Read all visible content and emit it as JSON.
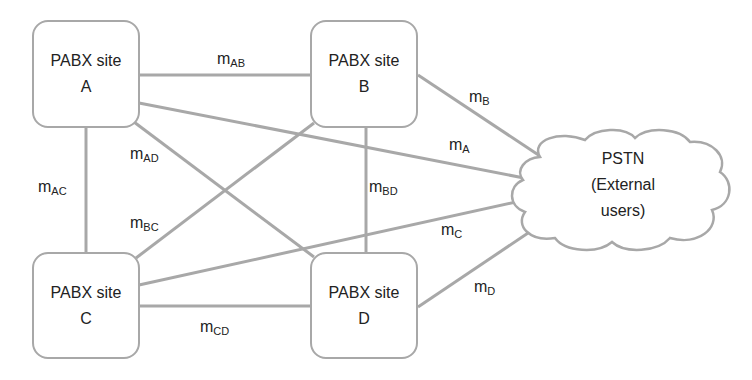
{
  "diagram": {
    "type": "network topology",
    "nodes": [
      {
        "id": "A",
        "line1": "PABX site",
        "line2": "A"
      },
      {
        "id": "B",
        "line1": "PABX site",
        "line2": "B"
      },
      {
        "id": "C",
        "line1": "PABX site",
        "line2": "C"
      },
      {
        "id": "D",
        "line1": "PABX site",
        "line2": "D"
      }
    ],
    "cloud": {
      "id": "PSTN",
      "line1": "PSTN",
      "line2": "(External",
      "line3": "users)"
    },
    "links": [
      {
        "from": "A",
        "to": "B",
        "label": "m",
        "sub": "AB"
      },
      {
        "from": "A",
        "to": "C",
        "label": "m",
        "sub": "AC"
      },
      {
        "from": "A",
        "to": "D",
        "label": "m",
        "sub": "AD"
      },
      {
        "from": "B",
        "to": "C",
        "label": "m",
        "sub": "BC"
      },
      {
        "from": "B",
        "to": "D",
        "label": "m",
        "sub": "BD"
      },
      {
        "from": "C",
        "to": "D",
        "label": "m",
        "sub": "CD"
      },
      {
        "from": "A",
        "to": "PSTN",
        "label": "m",
        "sub": "A"
      },
      {
        "from": "B",
        "to": "PSTN",
        "label": "m",
        "sub": "B"
      },
      {
        "from": "C",
        "to": "PSTN",
        "label": "m",
        "sub": "C"
      },
      {
        "from": "D",
        "to": "PSTN",
        "label": "m",
        "sub": "D"
      }
    ],
    "colors": {
      "line": "#a8a8a8",
      "text": "#222222",
      "background": "#ffffff"
    }
  }
}
